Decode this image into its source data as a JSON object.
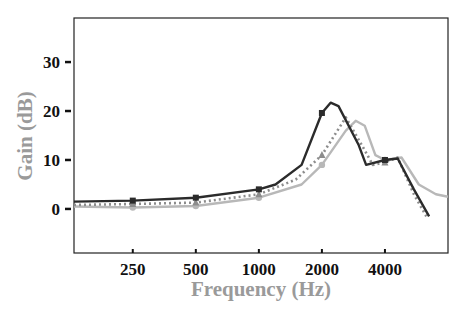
{
  "chart_data": {
    "type": "line",
    "title": "",
    "xlabel": "Frequency (Hz)",
    "ylabel": "Gain (dB)",
    "xscale": "log2",
    "xlim": [
      131,
      8000
    ],
    "ylim": [
      -9,
      39
    ],
    "xticks": [
      250,
      500,
      1000,
      2000,
      4000
    ],
    "xtick_labels": [
      "250",
      "500",
      "1000",
      "2000",
      "4000"
    ],
    "yticks": [
      0,
      10,
      20,
      30
    ],
    "ytick_labels": [
      "0",
      "10",
      "20",
      "30"
    ],
    "grid": false,
    "legend": null,
    "series": [
      {
        "name": "dark-solid",
        "style": "solid",
        "color": "#2b2b2b",
        "marker": "square",
        "x": [
          131,
          250,
          500,
          1000,
          1200,
          1600,
          2000,
          2200,
          2400,
          3000,
          3250,
          4000,
          4600,
          5500,
          6500
        ],
        "y": [
          1.5,
          1.7,
          2.3,
          4.0,
          5.0,
          9.0,
          19.6,
          21.7,
          21.0,
          13.0,
          9.0,
          10.0,
          10.3,
          4.0,
          -1.5
        ],
        "marker_x": [
          250,
          500,
          1000,
          2000,
          4000
        ]
      },
      {
        "name": "gray-dotted",
        "style": "dotted",
        "color": "#8c8c8c",
        "marker": "triangle",
        "x": [
          131,
          250,
          500,
          1000,
          1500,
          2000,
          2600,
          3200,
          3500,
          4000,
          4600,
          5500,
          6300
        ],
        "y": [
          0.8,
          1.0,
          1.3,
          3.0,
          6.0,
          11.0,
          18.7,
          12.0,
          9.0,
          9.5,
          10.5,
          3.0,
          -1.5
        ],
        "marker_x": [
          250,
          500,
          1000,
          2000,
          4000
        ]
      },
      {
        "name": "light-solid",
        "style": "solid",
        "color": "#b8b8b8",
        "marker": "circle",
        "x": [
          131,
          250,
          500,
          1000,
          1600,
          2000,
          2600,
          2900,
          3200,
          3600,
          4000,
          4800,
          5800,
          7000,
          8000
        ],
        "y": [
          0.5,
          0.3,
          0.6,
          2.3,
          5.0,
          9.0,
          16.0,
          18.0,
          17.0,
          11.0,
          10.0,
          10.5,
          5.0,
          3.0,
          2.5
        ],
        "marker_x": [
          250,
          500,
          1000,
          2000,
          4000
        ]
      }
    ]
  }
}
